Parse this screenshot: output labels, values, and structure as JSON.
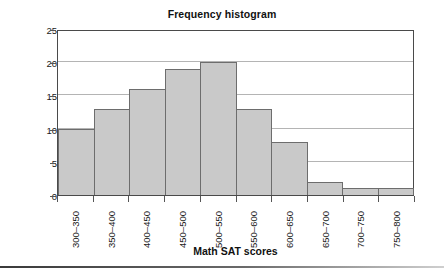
{
  "chart_data": {
    "type": "bar",
    "title": "Frequency histogram",
    "xlabel": "Math SAT scores",
    "ylabel": "Frequency",
    "categories": [
      "300–350",
      "350–400",
      "400–450",
      "450–500",
      "500–550",
      "550–600",
      "600–650",
      "650–700",
      "700–750",
      "750–800"
    ],
    "values": [
      10,
      13,
      16,
      19,
      20,
      13,
      8,
      2,
      1,
      1
    ],
    "ylim": [
      0,
      25
    ],
    "yticks": [
      0,
      5,
      10,
      15,
      20,
      25
    ],
    "ytick_labels": [
      "0",
      "5",
      "10",
      "15",
      "20",
      "25"
    ],
    "grid": true,
    "legend": false,
    "bar_fill_color": "#c9c9c9",
    "bar_edge_color": "#6d6d6d",
    "gridline_color": "#b4b4b4",
    "axis_color": "#4a4a4a"
  }
}
